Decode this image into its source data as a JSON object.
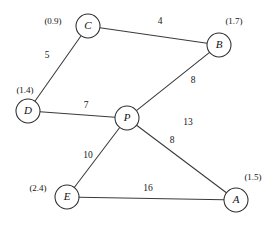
{
  "figure": {
    "kind": "weighted-undirected-graph",
    "background_color": "#ffffff",
    "stroke_color": "#3a3a3a",
    "node_fill_color": "#ffffff",
    "node_radius": 12
  },
  "nodes": [
    {
      "id": "C",
      "label": "C",
      "x": 88,
      "y": 26,
      "heuristic": "(0.9)",
      "heuristic_x": 53,
      "heuristic_y": 22
    },
    {
      "id": "B",
      "label": "B",
      "x": 219,
      "y": 45,
      "heuristic": "(1.7)",
      "heuristic_x": 234,
      "heuristic_y": 22
    },
    {
      "id": "D",
      "label": "D",
      "x": 28,
      "y": 111,
      "heuristic": "(1.4)",
      "heuristic_x": 25,
      "heuristic_y": 91
    },
    {
      "id": "P",
      "label": "P",
      "x": 127,
      "y": 118,
      "heuristic": "",
      "heuristic_x": 0,
      "heuristic_y": 0
    },
    {
      "id": "E",
      "label": "E",
      "x": 67,
      "y": 197,
      "heuristic": "(2.4)",
      "heuristic_x": 38,
      "heuristic_y": 189
    },
    {
      "id": "A",
      "label": "A",
      "x": 236,
      "y": 200,
      "heuristic": "(1.5)",
      "heuristic_x": 253,
      "heuristic_y": 178
    }
  ],
  "edges": [
    {
      "id": "C-B",
      "from": "C",
      "to": "B",
      "weight": "4",
      "label_x": 160,
      "label_y": 22
    },
    {
      "id": "C-D",
      "from": "C",
      "to": "D",
      "weight": "5",
      "label_x": 47,
      "label_y": 56
    },
    {
      "id": "D-P",
      "from": "D",
      "to": "P",
      "weight": "7",
      "label_x": 86,
      "label_y": 106
    },
    {
      "id": "P-B",
      "from": "P",
      "to": "B",
      "weight": "8",
      "label_x": 193,
      "label_y": 81
    },
    {
      "id": "P-A",
      "from": "P",
      "to": "A",
      "weight": "8",
      "label_x": 172,
      "label_y": 141
    },
    {
      "id": "P-E",
      "from": "P",
      "to": "E",
      "weight": "10",
      "label_x": 88,
      "label_y": 156
    },
    {
      "id": "E-A",
      "from": "E",
      "to": "A",
      "weight": "16",
      "label_x": 148,
      "label_y": 189
    }
  ],
  "floating_labels": [
    {
      "id": "thirteen",
      "text": "13",
      "x": 188,
      "y": 123
    }
  ]
}
